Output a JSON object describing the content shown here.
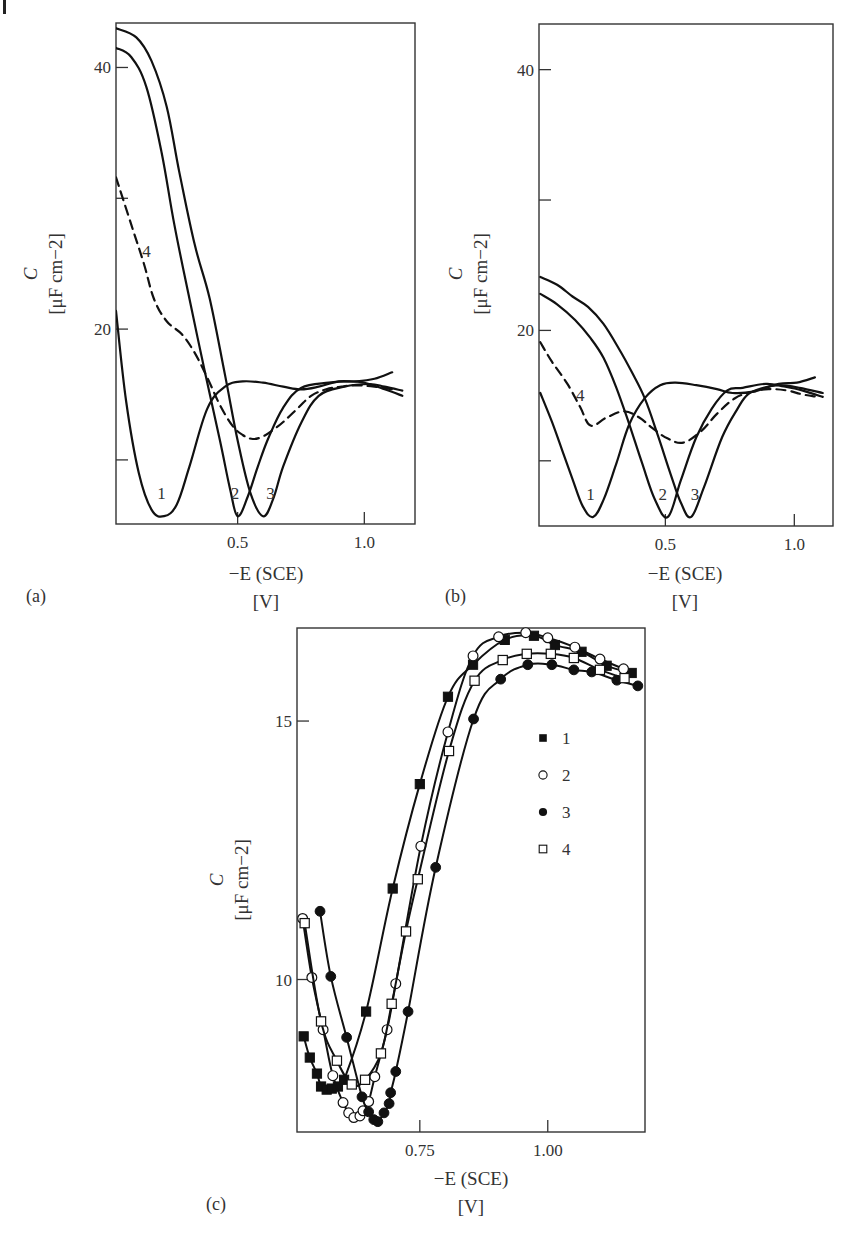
{
  "chart_data": [
    {
      "id": "a",
      "type": "line",
      "panel_label": "(a)",
      "title": "",
      "xlabel": "−E (SCE)",
      "xunit": "[V]",
      "ylabel": "C",
      "yunit": "[μF cm−2]",
      "xlim": [
        0.02,
        1.2
      ],
      "ylim": [
        5.1,
        43.4
      ],
      "xticks": [
        {
          "value": 0.5,
          "label": "0.5"
        },
        {
          "value": 1.0,
          "label": "1.0"
        }
      ],
      "yticks": [
        {
          "value": 10,
          "label": ""
        },
        {
          "value": 20,
          "label": "20"
        },
        {
          "value": 30,
          "label": ""
        },
        {
          "value": 40,
          "label": "40"
        }
      ],
      "grid": false,
      "series": [
        {
          "name": "1",
          "style": "solid",
          "label_at": [
            0.2,
            7.0
          ],
          "x": [
            0.02,
            0.06,
            0.11,
            0.16,
            0.21,
            0.26,
            0.31,
            0.38,
            0.45,
            0.52,
            0.6,
            0.68,
            0.75,
            0.82,
            0.9,
            0.97,
            1.04,
            1.11
          ],
          "y": [
            21.4,
            14.5,
            9.0,
            6.2,
            5.7,
            6.6,
            9.5,
            13.9,
            15.6,
            16.0,
            15.9,
            15.6,
            15.4,
            15.6,
            16.0,
            16.0,
            16.2,
            16.7
          ]
        },
        {
          "name": "2",
          "style": "solid",
          "label_at": [
            0.49,
            7.0
          ],
          "x": [
            0.02,
            0.08,
            0.14,
            0.2,
            0.25,
            0.31,
            0.37,
            0.43,
            0.47,
            0.5,
            0.54,
            0.58,
            0.62,
            0.68,
            0.75,
            0.86,
            0.94,
            1.0,
            1.08,
            1.15
          ],
          "y": [
            41.5,
            40.8,
            38.5,
            33.5,
            28.0,
            22.3,
            16.8,
            11.5,
            7.8,
            5.7,
            7.2,
            9.5,
            11.6,
            14.0,
            15.5,
            15.9,
            16.0,
            15.9,
            15.4,
            14.9
          ]
        },
        {
          "name": "3",
          "style": "solid",
          "label_at": [
            0.63,
            7.0
          ],
          "x": [
            0.02,
            0.1,
            0.16,
            0.22,
            0.27,
            0.33,
            0.39,
            0.45,
            0.5,
            0.55,
            0.6,
            0.64,
            0.68,
            0.75,
            0.82,
            0.92,
            1.02,
            1.08,
            1.15
          ],
          "y": [
            43.0,
            42.3,
            40.5,
            37.0,
            32.0,
            26.5,
            22.3,
            16.5,
            11.5,
            7.5,
            5.7,
            7.0,
            9.5,
            12.8,
            14.9,
            15.6,
            15.8,
            15.6,
            15.3
          ]
        },
        {
          "name": "4",
          "style": "dashed",
          "label_at": [
            0.14,
            25.5
          ],
          "x": [
            0.02,
            0.08,
            0.13,
            0.17,
            0.22,
            0.28,
            0.33,
            0.38,
            0.43,
            0.48,
            0.52,
            0.56,
            0.6,
            0.64,
            0.68,
            0.74,
            0.79,
            0.85,
            0.91,
            0.97,
            1.04,
            1.11
          ],
          "y": [
            31.6,
            28.0,
            25.0,
            22.3,
            20.6,
            19.6,
            18.2,
            16.3,
            14.2,
            12.6,
            11.9,
            11.6,
            11.8,
            12.3,
            12.9,
            14.0,
            14.9,
            15.4,
            15.6,
            15.7,
            15.6,
            15.4
          ]
        }
      ]
    },
    {
      "id": "b",
      "type": "line",
      "panel_label": "(b)",
      "title": "",
      "xlabel": "−E (SCE)",
      "xunit": "[V]",
      "ylabel": "C",
      "yunit": "[μF cm−2]",
      "xlim": [
        0.01,
        1.15
      ],
      "ylim": [
        5.0,
        43.5
      ],
      "xticks": [
        {
          "value": 0.5,
          "label": "0.5"
        },
        {
          "value": 1.0,
          "label": "1.0"
        }
      ],
      "yticks": [
        {
          "value": 10,
          "label": ""
        },
        {
          "value": 20,
          "label": "20"
        },
        {
          "value": 30,
          "label": ""
        },
        {
          "value": 40,
          "label": "40"
        }
      ],
      "grid": false,
      "series": [
        {
          "name": "1",
          "style": "solid",
          "label_at": [
            0.21,
            7.0
          ],
          "x": [
            0.015,
            0.06,
            0.1,
            0.14,
            0.18,
            0.22,
            0.26,
            0.31,
            0.36,
            0.42,
            0.48,
            0.54,
            0.62,
            0.7,
            0.76,
            0.84,
            0.94,
            1.01,
            1.08
          ],
          "y": [
            15.2,
            13.0,
            10.8,
            8.6,
            6.5,
            5.7,
            7.0,
            9.8,
            12.8,
            14.8,
            15.8,
            16.0,
            15.8,
            15.5,
            15.2,
            15.3,
            15.9,
            16.0,
            16.4
          ]
        },
        {
          "name": "2",
          "style": "solid",
          "label_at": [
            0.49,
            7.0
          ],
          "x": [
            0.015,
            0.08,
            0.15,
            0.21,
            0.26,
            0.31,
            0.36,
            0.41,
            0.46,
            0.51,
            0.56,
            0.62,
            0.68,
            0.74,
            0.8,
            0.89,
            0.96,
            1.03,
            1.11
          ],
          "y": [
            22.8,
            22.0,
            20.8,
            19.4,
            17.9,
            15.6,
            12.8,
            9.8,
            7.0,
            5.7,
            8.5,
            11.8,
            14.0,
            15.4,
            15.6,
            15.9,
            15.7,
            15.4,
            14.9
          ]
        },
        {
          "name": "3",
          "style": "solid",
          "label_at": [
            0.615,
            7.0
          ],
          "x": [
            0.015,
            0.08,
            0.14,
            0.2,
            0.26,
            0.32,
            0.37,
            0.42,
            0.47,
            0.52,
            0.56,
            0.6,
            0.65,
            0.72,
            0.78,
            0.82,
            0.88,
            0.94,
            1.02,
            1.11
          ],
          "y": [
            24.1,
            23.5,
            22.6,
            21.8,
            20.5,
            18.6,
            16.8,
            14.8,
            12.0,
            9.0,
            6.8,
            5.7,
            8.0,
            11.8,
            14.0,
            15.1,
            15.6,
            15.8,
            15.6,
            15.2
          ]
        },
        {
          "name": "4",
          "style": "dashed",
          "label_at": [
            0.17,
            14.6
          ],
          "x": [
            0.015,
            0.06,
            0.12,
            0.17,
            0.21,
            0.27,
            0.34,
            0.4,
            0.45,
            0.51,
            0.57,
            0.64,
            0.7,
            0.77,
            0.84,
            0.9,
            0.97,
            1.03,
            1.09
          ],
          "y": [
            19.1,
            17.6,
            15.9,
            14.1,
            12.7,
            13.3,
            13.8,
            13.3,
            12.5,
            11.7,
            11.4,
            12.3,
            13.6,
            14.8,
            15.3,
            15.5,
            15.4,
            15.1,
            14.9
          ]
        }
      ]
    },
    {
      "id": "c",
      "type": "line",
      "panel_label": "(c)",
      "title": "",
      "xlabel": "−E (SCE)",
      "xunit": "[V]",
      "ylabel": "C",
      "yunit": "[μF cm−2]",
      "xlim": [
        0.51,
        1.19
      ],
      "ylim": [
        7.05,
        16.8
      ],
      "xticks": [
        {
          "value": 0.75,
          "label": "0.75"
        },
        {
          "value": 1.0,
          "label": "1.00"
        }
      ],
      "yticks": [
        {
          "value": 10,
          "label": "10"
        },
        {
          "value": 15,
          "label": "15"
        }
      ],
      "grid": false,
      "legend": {
        "position": "inside-right",
        "entries": [
          {
            "name": "1",
            "marker": "filled-square"
          },
          {
            "name": "2",
            "marker": "open-circle"
          },
          {
            "name": "3",
            "marker": "filled-circle"
          },
          {
            "name": "4",
            "marker": "open-square"
          }
        ]
      },
      "series": [
        {
          "name": "1",
          "marker": "filled-square",
          "x": [
            0.523,
            0.535,
            0.549,
            0.557,
            0.568,
            0.578,
            0.59,
            0.602,
            0.645,
            0.697,
            0.75,
            0.805,
            0.854,
            0.916,
            0.973,
            1.014,
            1.066,
            1.115,
            1.164
          ],
          "y": [
            8.9,
            8.49,
            8.18,
            7.93,
            7.87,
            7.89,
            7.93,
            8.06,
            9.38,
            11.76,
            13.78,
            15.47,
            16.09,
            16.57,
            16.65,
            16.47,
            16.34,
            16.07,
            15.93
          ]
        },
        {
          "name": "2",
          "marker": "open-circle",
          "x": [
            0.521,
            0.539,
            0.561,
            0.58,
            0.6,
            0.611,
            0.621,
            0.633,
            0.639,
            0.65,
            0.662,
            0.686,
            0.703,
            0.752,
            0.805,
            0.854,
            0.904,
            0.957,
            1.0,
            1.053,
            1.102,
            1.148
          ],
          "y": [
            11.18,
            10.04,
            9.03,
            8.14,
            7.62,
            7.42,
            7.33,
            7.36,
            7.46,
            7.64,
            8.12,
            9.03,
            9.92,
            12.58,
            14.79,
            16.26,
            16.63,
            16.71,
            16.61,
            16.43,
            16.2,
            16.01
          ]
        },
        {
          "name": "3",
          "marker": "filled-circle",
          "x": [
            0.555,
            0.576,
            0.607,
            0.637,
            0.65,
            0.66,
            0.668,
            0.68,
            0.69,
            0.693,
            0.703,
            0.727,
            0.781,
            0.855,
            0.908,
            0.961,
            1.008,
            1.051,
            1.086,
            1.135,
            1.176
          ],
          "y": [
            11.32,
            10.06,
            8.88,
            7.73,
            7.44,
            7.29,
            7.25,
            7.42,
            7.6,
            7.81,
            8.22,
            9.38,
            12.17,
            15.04,
            15.81,
            16.09,
            16.09,
            15.99,
            15.95,
            15.79,
            15.68
          ]
        },
        {
          "name": "4",
          "marker": "open-square",
          "x": [
            0.525,
            0.557,
            0.588,
            0.617,
            0.643,
            0.674,
            0.695,
            0.723,
            0.746,
            0.807,
            0.857,
            0.912,
            0.959,
            1.006,
            1.051,
            1.102,
            1.15
          ],
          "y": [
            11.09,
            9.19,
            8.43,
            7.97,
            8.06,
            8.57,
            9.53,
            10.93,
            11.94,
            14.42,
            15.78,
            16.18,
            16.3,
            16.3,
            16.22,
            15.99,
            15.83
          ]
        }
      ]
    }
  ],
  "layout": {
    "a": {
      "frame": [
        116,
        23,
        415,
        524
      ]
    },
    "b": {
      "frame": [
        539,
        24,
        833,
        526
      ]
    },
    "c": {
      "frame": [
        297,
        628,
        645,
        1132
      ]
    }
  }
}
